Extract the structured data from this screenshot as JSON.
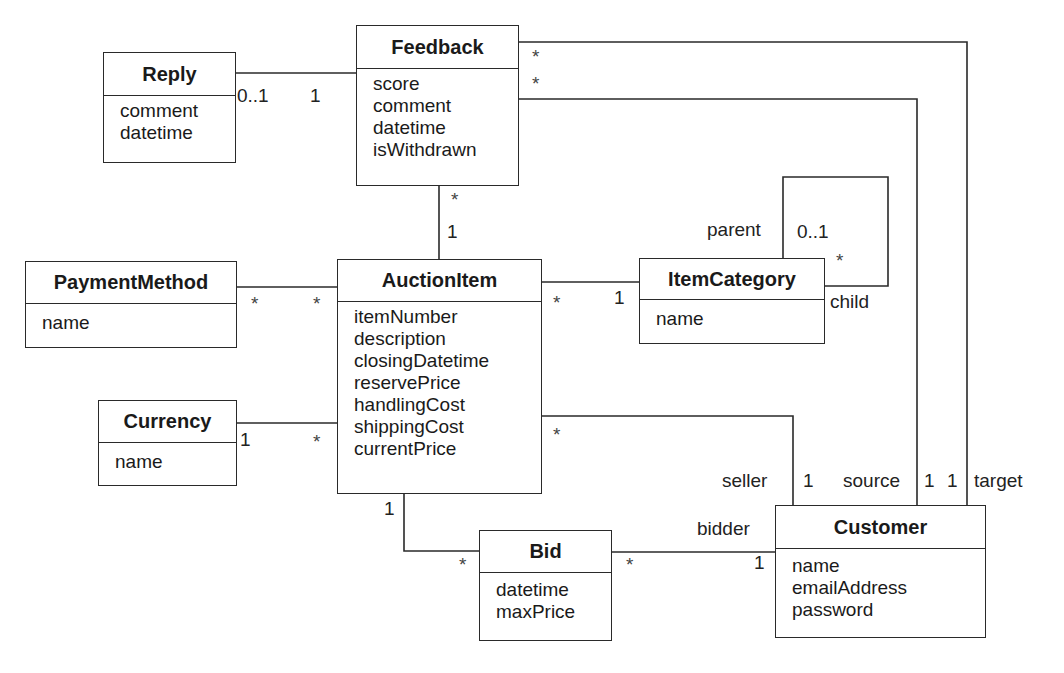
{
  "diagram": {
    "type": "UML class diagram",
    "classes": [
      {
        "id": "reply",
        "name": "Reply",
        "attributes": [
          "comment",
          "datetime"
        ]
      },
      {
        "id": "feedback",
        "name": "Feedback",
        "attributes": [
          "score",
          "comment",
          "datetime",
          "isWithdrawn"
        ]
      },
      {
        "id": "payment_method",
        "name": "PaymentMethod",
        "attributes": [
          "name"
        ]
      },
      {
        "id": "auction_item",
        "name": "AuctionItem",
        "attributes": [
          "itemNumber",
          "description",
          "closingDatetime",
          "reservePrice",
          "handlingCost",
          "shippingCost",
          "currentPrice"
        ]
      },
      {
        "id": "item_category",
        "name": "ItemCategory",
        "attributes": [
          "name"
        ]
      },
      {
        "id": "currency",
        "name": "Currency",
        "attributes": [
          "name"
        ]
      },
      {
        "id": "bid",
        "name": "Bid",
        "attributes": [
          "datetime",
          "maxPrice"
        ]
      },
      {
        "id": "customer",
        "name": "Customer",
        "attributes": [
          "name",
          "emailAddress",
          "password"
        ]
      }
    ],
    "associations": [
      {
        "from": "Reply",
        "from_mult": "0..1",
        "to": "Feedback",
        "to_mult": "1"
      },
      {
        "from": "Feedback",
        "from_mult": "*",
        "to": "AuctionItem",
        "to_mult": "1"
      },
      {
        "from": "PaymentMethod",
        "from_mult": "*",
        "to": "AuctionItem",
        "to_mult": "*"
      },
      {
        "from": "AuctionItem",
        "from_mult": "*",
        "to": "ItemCategory",
        "to_mult": "1"
      },
      {
        "from": "ItemCategory",
        "from_role": "parent",
        "from_mult": "0..1",
        "to": "ItemCategory",
        "to_role": "child",
        "to_mult": "*"
      },
      {
        "from": "Currency",
        "from_mult": "1",
        "to": "AuctionItem",
        "to_mult": "*"
      },
      {
        "from": "AuctionItem",
        "from_mult": "*",
        "to": "Customer",
        "to_role": "seller",
        "to_mult": "1"
      },
      {
        "from": "AuctionItem",
        "from_mult": "1",
        "to": "Bid",
        "to_mult": "*"
      },
      {
        "from": "Bid",
        "from_mult": "*",
        "to": "Customer",
        "to_role": "bidder",
        "to_mult": "1"
      },
      {
        "from": "Feedback",
        "from_mult": "*",
        "to": "Customer",
        "to_role": "source",
        "to_mult": "1"
      },
      {
        "from": "Feedback",
        "from_mult": "*",
        "to": "Customer",
        "to_role": "target",
        "to_mult": "1"
      }
    ]
  },
  "labels": {
    "reply_feedback_reply_end": "0..1",
    "reply_feedback_feedback_end": "1",
    "feedback_target_star": "*",
    "feedback_source_star": "*",
    "feedback_auction_star": "*",
    "feedback_auction_one": "1",
    "payment_star": "*",
    "payment_auction_star": "*",
    "auction_category_star": "*",
    "auction_category_one": "1",
    "category_parent_role": "parent",
    "category_parent_mult": "0..1",
    "category_child_mult": "*",
    "category_child_role": "child",
    "currency_one": "1",
    "currency_auction_star": "*",
    "auction_seller_star": "*",
    "seller_role": "seller",
    "seller_mult": "1",
    "source_role": "source",
    "source_mult": "1",
    "target_mult": "1",
    "target_role": "target",
    "auction_bid_one": "1",
    "auction_bid_star": "*",
    "bid_customer_star": "*",
    "bidder_role": "bidder",
    "bidder_mult": "1"
  }
}
